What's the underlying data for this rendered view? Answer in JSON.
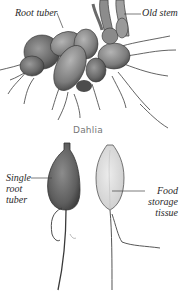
{
  "figure": {
    "top_group": {
      "caption": "Dahlia",
      "labels": {
        "root_tuber": "Root tuber",
        "old_stem": "Old stem"
      }
    },
    "bottom_group": {
      "labels": {
        "single_root_tuber": [
          "Single",
          "root",
          "tuber"
        ],
        "food_storage_tissue": [
          "Food",
          "storage",
          "tissue"
        ]
      }
    },
    "colors": {
      "background": "#ffffff",
      "tuber_dark": "#5a5a5a",
      "tuber_mid": "#8a8a8a",
      "tuber_light": "#d6d6d6",
      "outline": "#3a3a3a",
      "leader_line": "#444444",
      "caption_text": "#777777"
    }
  }
}
